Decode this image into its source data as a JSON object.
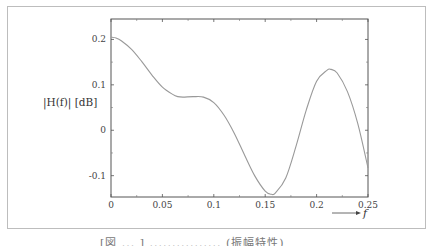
{
  "chart_data": {
    "type": "line",
    "title": "",
    "xlabel": "f",
    "ylabel": "|H(f)| [dB]",
    "xlim": [
      0,
      0.25
    ],
    "ylim": [
      -0.147,
      0.245
    ],
    "grid": false,
    "legend": null,
    "x_ticks": [
      0,
      0.05,
      0.1,
      0.15,
      0.2,
      0.25
    ],
    "x_tick_labels": [
      "0",
      "0.05",
      "0.1",
      "0.15",
      "0.2",
      "0.25"
    ],
    "y_ticks": [
      -0.1,
      0,
      0.1,
      0.2
    ],
    "y_tick_labels": [
      "-0.1",
      "0",
      "0.1",
      "0.2"
    ],
    "series": [
      {
        "name": "|H(f)|",
        "color": "#999999",
        "x": [
          0,
          0.005,
          0.01,
          0.02,
          0.03,
          0.04,
          0.05,
          0.06,
          0.065,
          0.07,
          0.08,
          0.09,
          0.1,
          0.11,
          0.12,
          0.13,
          0.14,
          0.15,
          0.156,
          0.16,
          0.17,
          0.18,
          0.19,
          0.2,
          0.21,
          0.214,
          0.22,
          0.23,
          0.24,
          0.25
        ],
        "y": [
          0.205,
          0.203,
          0.197,
          0.178,
          0.151,
          0.121,
          0.095,
          0.079,
          0.074,
          0.073,
          0.074,
          0.073,
          0.061,
          0.033,
          -0.007,
          -0.055,
          -0.101,
          -0.134,
          -0.141,
          -0.138,
          -0.105,
          -0.035,
          0.045,
          0.108,
          0.132,
          0.134,
          0.126,
          0.085,
          0.015,
          -0.083
        ]
      }
    ]
  },
  "axis": {
    "ylabel": "|H(f)| [dB]",
    "xlabel": "f",
    "x_tick_labels": [
      "0",
      "0.05",
      "0.1",
      "0.15",
      "0.2",
      "0.25"
    ],
    "y_tick_labels": [
      "0.2",
      "0.1",
      "0",
      "-0.1"
    ]
  },
  "caption": "[図 ... ] ................ (振幅特性)"
}
